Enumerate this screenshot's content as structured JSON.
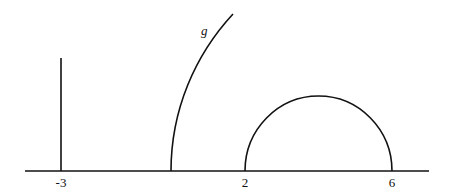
{
  "diagram": {
    "curve_label": "g",
    "axis_labels": [
      {
        "text": "-3",
        "x": 61
      },
      {
        "text": "2",
        "x": 245
      },
      {
        "text": "6",
        "x": 392
      }
    ],
    "elements": [
      {
        "type": "horizontal-axis",
        "description": "x-axis"
      },
      {
        "type": "vertical-segment",
        "at": "-3"
      },
      {
        "type": "quarter-arc",
        "label": "g",
        "starts_between": [
          "-3",
          "2"
        ]
      },
      {
        "type": "semicircle",
        "from": "2",
        "to": "6"
      }
    ],
    "colors": {
      "stroke": "#111111",
      "background": "#ffffff"
    }
  }
}
